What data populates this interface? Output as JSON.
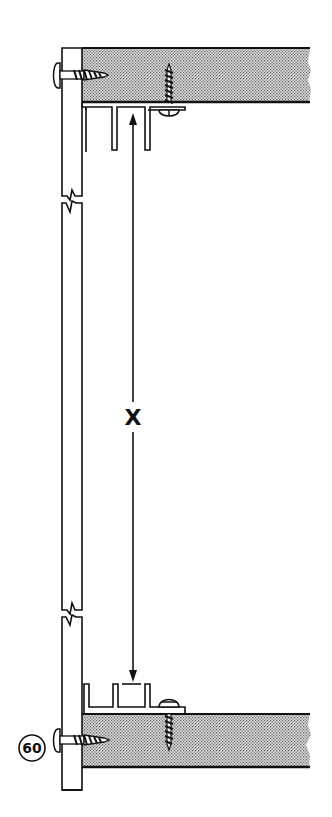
{
  "diagram": {
    "type": "technical cross-section drawing",
    "dimension_label": "X",
    "callout_number": "60",
    "components": [
      {
        "id": "vertical-panel",
        "description": "Vertical side panel with two break marks"
      },
      {
        "id": "top-board",
        "description": "Shaded top board"
      },
      {
        "id": "bottom-board",
        "description": "Shaded bottom board"
      },
      {
        "id": "top-track",
        "description": "Upper drawer/door track with fins, screwed to top board"
      },
      {
        "id": "bottom-track",
        "description": "Lower track with fins, screwed to bottom board"
      },
      {
        "id": "side-screws",
        "description": "Screws through vertical panel into boards (top & bottom)"
      },
      {
        "id": "track-screws",
        "description": "Screws fastening tracks to boards"
      },
      {
        "id": "dimension-arrow",
        "description": "Double-headed arrow measuring distance X between tracks"
      }
    ],
    "colors": {
      "line": "#111111",
      "shade": "#b8b8b8",
      "background": "#ffffff"
    }
  }
}
